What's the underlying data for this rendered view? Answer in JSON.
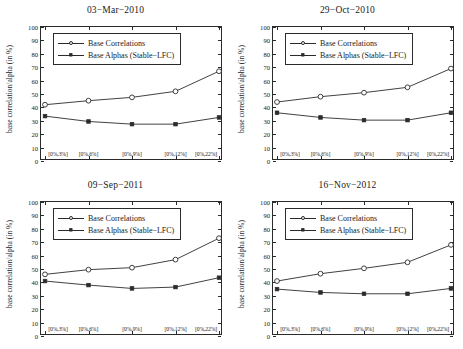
{
  "figure": {
    "width": 463,
    "height": 349,
    "background": "#ffffff",
    "line_color": "#2b2b2b",
    "axis_color": "#2b2b2b"
  },
  "axes": {
    "ylabel": "base correlation/alpha (in %)",
    "ylim": [
      0,
      100
    ],
    "yticks": [
      0,
      10,
      20,
      30,
      40,
      50,
      60,
      70,
      80,
      90,
      100
    ],
    "ytick_labels": [
      "0",
      "10",
      "20",
      "30",
      "40",
      "50",
      "60",
      "70",
      "80",
      "90",
      "100"
    ],
    "xtick_labels": [
      "[0%,3%]",
      "[0%,6%]",
      "[0%,9%]",
      "[0%,12%]",
      "[0%,22%]"
    ],
    "xlabel": "",
    "grid": false
  },
  "legend": {
    "position": "top-left",
    "entries": [
      {
        "label": "Base Correlations",
        "marker": "circle-open-icon"
      },
      {
        "label": "Base Alphas (Stable−LFC)",
        "marker": "square-filled-icon"
      }
    ]
  },
  "chart_data": [
    {
      "type": "line",
      "title": "03−Mar−2010",
      "xlabel": "",
      "ylabel": "base correlation/alpha (in %)",
      "ylim": [
        0,
        100
      ],
      "categories": [
        "[0%,3%]",
        "[0%,6%]",
        "[0%,9%]",
        "[0%,12%]",
        "[0%,22%]"
      ],
      "series": [
        {
          "name": "Base Correlations",
          "marker": "circle-open-icon",
          "values": [
            42,
            45,
            47.5,
            52,
            67
          ]
        },
        {
          "name": "Base Alphas (Stable−LFC)",
          "marker": "square-filled-icon",
          "values": [
            33.5,
            29.5,
            27.5,
            27.5,
            32.5
          ]
        }
      ]
    },
    {
      "type": "line",
      "title": "29−Oct−2010",
      "xlabel": "",
      "ylabel": "base correlation/alpha (in %)",
      "ylim": [
        0,
        100
      ],
      "categories": [
        "[0%,3%]",
        "[0%,6%]",
        "[0%,9%]",
        "[0%,12%]",
        "[0%,22%]"
      ],
      "series": [
        {
          "name": "Base Correlations",
          "marker": "circle-open-icon",
          "values": [
            44,
            48,
            51,
            55,
            69
          ]
        },
        {
          "name": "Base Alphas (Stable−LFC)",
          "marker": "square-filled-icon",
          "values": [
            36,
            32.5,
            30.5,
            30.5,
            36
          ]
        }
      ]
    },
    {
      "type": "line",
      "title": "09−Sep−2011",
      "xlabel": "",
      "ylabel": "base correlation/alpha (in %)",
      "ylim": [
        0,
        100
      ],
      "categories": [
        "[0%,3%]",
        "[0%,6%]",
        "[0%,9%]",
        "[0%,12%]",
        "[0%,22%]"
      ],
      "series": [
        {
          "name": "Base Correlations",
          "marker": "circle-open-icon",
          "values": [
            46,
            49.5,
            51,
            57,
            73
          ]
        },
        {
          "name": "Base Alphas (Stable−LFC)",
          "marker": "square-filled-icon",
          "values": [
            41,
            38,
            35.5,
            36.5,
            43.5
          ]
        }
      ]
    },
    {
      "type": "line",
      "title": "16−Nov−2012",
      "xlabel": "",
      "ylabel": "base correlation/alpha (in %)",
      "ylim": [
        0,
        100
      ],
      "categories": [
        "[0%,3%]",
        "[0%,6%]",
        "[0%,9%]",
        "[0%,12%]",
        "[0%,22%]"
      ],
      "series": [
        {
          "name": "Base Correlations",
          "marker": "circle-open-icon",
          "values": [
            41,
            46.5,
            50.5,
            55,
            68
          ]
        },
        {
          "name": "Base Alphas (Stable−LFC)",
          "marker": "square-filled-icon",
          "values": [
            35,
            32.5,
            31.5,
            31.5,
            35.5
          ]
        }
      ]
    }
  ]
}
